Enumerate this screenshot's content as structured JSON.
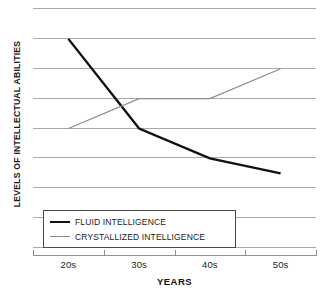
{
  "chart_data": {
    "type": "line",
    "title": "",
    "xlabel": "YEARS",
    "ylabel": "LEVELS OF INTELLECTUAL ABILITIES",
    "categories": [
      "20s",
      "30s",
      "40s",
      "50s"
    ],
    "ylim": [
      0,
      8
    ],
    "yticks": [
      0,
      1,
      2,
      3,
      4,
      5,
      6,
      7,
      8
    ],
    "ytick_labels": [],
    "grid": "horizontal",
    "legend_position": "inside-bottom-left",
    "series": [
      {
        "name": "FLUID INTELLIGENCE",
        "color": "#111111",
        "width": 2.4,
        "values": [
          7,
          4,
          3,
          2.5
        ]
      },
      {
        "name": "CRYSTALLIZED INTELLIGENCE",
        "color": "#8d8d8d",
        "width": 1.3,
        "values": [
          4,
          5,
          5,
          6
        ]
      }
    ]
  },
  "axes": {
    "y_title": "LEVELS OF INTELLECTUAL ABILITIES",
    "x_title": "YEARS",
    "x_labels": [
      "20s",
      "30s",
      "40s",
      "50s"
    ]
  },
  "legend": {
    "entries": [
      {
        "label": "FLUID INTELLIGENCE",
        "swatch": "fluid-line-swatch"
      },
      {
        "label": "CRYSTALLIZED INTELLIGENCE",
        "swatch": "crystallized-line-swatch"
      }
    ]
  }
}
